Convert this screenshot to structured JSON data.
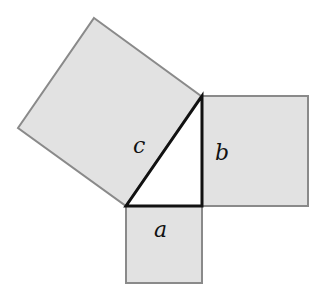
{
  "diagram": {
    "labels": {
      "a": "a",
      "b": "b",
      "c": "c"
    },
    "colors": {
      "square_fill": "#e2e2e2",
      "square_stroke": "#8a8a8a",
      "triangle_fill": "#ffffff",
      "triangle_stroke": "#111111"
    }
  }
}
